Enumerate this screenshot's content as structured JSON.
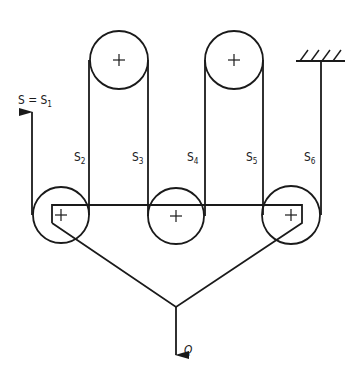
{
  "diagram": {
    "type": "pulley-system",
    "colors": {
      "line": "#1a1a1a",
      "background": "#ffffff"
    },
    "labels": {
      "input_force": {
        "main": "S = S",
        "sub": "1"
      },
      "s2": {
        "main": "S",
        "sub": "2"
      },
      "s3": {
        "main": "S",
        "sub": "3"
      },
      "s4": {
        "main": "S",
        "sub": "4"
      },
      "s5": {
        "main": "S",
        "sub": "5"
      },
      "s6": {
        "main": "S",
        "sub": "6"
      },
      "load": "Q"
    },
    "pulleys": [
      {
        "id": "top-left",
        "cx": 119,
        "cy": 60,
        "r": 29,
        "role": "fixed"
      },
      {
        "id": "top-right",
        "cx": 234,
        "cy": 60,
        "r": 29,
        "role": "fixed"
      },
      {
        "id": "bottom-left",
        "cx": 61,
        "cy": 215,
        "r": 28,
        "role": "moving"
      },
      {
        "id": "bottom-middle",
        "cx": 176,
        "cy": 216,
        "r": 28,
        "role": "moving"
      },
      {
        "id": "bottom-right",
        "cx": 291,
        "cy": 215,
        "r": 29,
        "role": "moving"
      }
    ],
    "rope_segments": [
      "S1",
      "S2",
      "S3",
      "S4",
      "S5",
      "S6"
    ],
    "ceiling_anchor": {
      "x": 321,
      "y": 61
    }
  }
}
